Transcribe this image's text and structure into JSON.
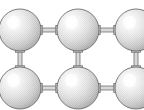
{
  "figure": {
    "background_color": "#ffffff",
    "width": 144,
    "height": 110
  },
  "style": {
    "sphere_fill_light": "#fdfdfd",
    "sphere_fill_mid": "#e9e9e9",
    "sphere_fill_dark": "#bdbdbd",
    "sphere_outline": "#6e6e6e",
    "connector_fill": "#d8d8d8",
    "connector_outline": "#707070",
    "highlight_color": "#ffffff",
    "texture": "halftone-dither"
  },
  "layout": {
    "columns": 3,
    "rows": 2,
    "sphere_radius": 21,
    "column_centers": [
      20,
      78,
      136
    ],
    "row_centers": [
      30,
      88
    ],
    "highlight_offset_x": -6,
    "highlight_offset_y": -7
  },
  "spheres": [
    {
      "name": "sphere-r1-c1",
      "cx": 20,
      "cy": 30,
      "r": 21,
      "row": 1,
      "col": 1
    },
    {
      "name": "sphere-r1-c2",
      "cx": 78,
      "cy": 30,
      "r": 21,
      "row": 1,
      "col": 2
    },
    {
      "name": "sphere-r1-c3",
      "cx": 136,
      "cy": 30,
      "r": 21,
      "row": 1,
      "col": 3
    },
    {
      "name": "sphere-r2-c1",
      "cx": 20,
      "cy": 88,
      "r": 21,
      "row": 2,
      "col": 1
    },
    {
      "name": "sphere-r2-c2",
      "cx": 78,
      "cy": 88,
      "r": 21,
      "row": 2,
      "col": 2
    },
    {
      "name": "sphere-r2-c3",
      "cx": 136,
      "cy": 88,
      "r": 21,
      "row": 2,
      "col": 3
    }
  ],
  "connectors": [
    {
      "name": "connector-h-r1-c1-c2",
      "orientation": "horizontal",
      "x": 41,
      "y": 30,
      "length": 16,
      "thickness": 4
    },
    {
      "name": "connector-h-r1-c2-c3",
      "orientation": "horizontal",
      "x": 99,
      "y": 30,
      "length": 16,
      "thickness": 4
    },
    {
      "name": "connector-h-r2-c1-c2",
      "orientation": "horizontal",
      "x": 41,
      "y": 88,
      "length": 16,
      "thickness": 4
    },
    {
      "name": "connector-h-r2-c2-c3",
      "orientation": "horizontal",
      "x": 99,
      "y": 88,
      "length": 16,
      "thickness": 4
    },
    {
      "name": "connector-v-c1-r1-r2",
      "orientation": "vertical",
      "x": 20,
      "y": 51,
      "length": 16,
      "thickness": 4
    },
    {
      "name": "connector-v-c2-r1-r2",
      "orientation": "vertical",
      "x": 78,
      "y": 51,
      "length": 16,
      "thickness": 4
    },
    {
      "name": "connector-v-c3-r1-r2",
      "orientation": "vertical",
      "x": 136,
      "y": 51,
      "length": 16,
      "thickness": 4
    }
  ]
}
